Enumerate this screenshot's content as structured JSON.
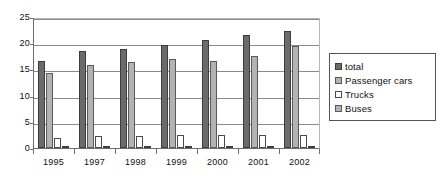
{
  "chart_data": {
    "type": "bar",
    "title": "",
    "subtitle": "",
    "xlabel": "",
    "ylabel": "",
    "categories": [
      "1995",
      "1997",
      "1998",
      "1999",
      "2000",
      "2001",
      "2002"
    ],
    "series": [
      {
        "name": "total",
        "color": "#6b6b6b",
        "values": [
          16.6,
          18.5,
          18.9,
          19.7,
          20.6,
          21.6,
          22.3
        ]
      },
      {
        "name": "Passenger cars",
        "color": "#b3b3b3",
        "values": [
          14.3,
          15.9,
          16.5,
          16.9,
          16.7,
          17.6,
          19.4
        ]
      },
      {
        "name": "Trucks",
        "color": "#ffffff",
        "values": [
          2.0,
          2.2,
          2.2,
          2.4,
          2.5,
          2.5,
          2.5
        ]
      },
      {
        "name": "Buses",
        "color": "#6b6b6b",
        "values": [
          0.2,
          0.2,
          0.2,
          0.2,
          0.2,
          0.2,
          0.2
        ]
      }
    ],
    "ylim": [
      0,
      25
    ],
    "yticks": [
      0,
      5,
      10,
      15,
      20,
      25
    ],
    "ytick_labels": [
      "0",
      "5",
      "10",
      "15",
      "20",
      "25"
    ],
    "grid": true,
    "grid_axis": "y",
    "legend_position": "right",
    "legend_entries": [
      "total",
      "Passenger cars",
      "Trucks",
      "Buses"
    ],
    "annotations": []
  },
  "legend": {
    "items": [
      {
        "label": "total"
      },
      {
        "label": "Passenger cars"
      },
      {
        "label": "Trucks"
      },
      {
        "label": "Buses"
      }
    ]
  }
}
